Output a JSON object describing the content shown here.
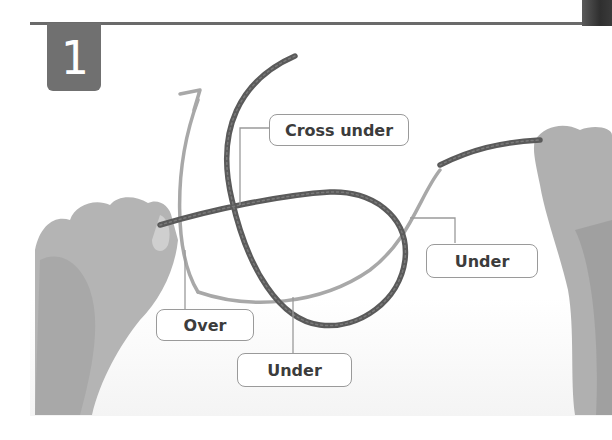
{
  "step": {
    "number": "1"
  },
  "callouts": [
    {
      "id": "cross-under",
      "label": "Cross under"
    },
    {
      "id": "over",
      "label": "Over"
    },
    {
      "id": "under-bottom",
      "label": "Under"
    },
    {
      "id": "under-right",
      "label": "Under"
    }
  ],
  "illustration": {
    "subject": "rope-knot-step",
    "elements": [
      "left-hand",
      "right-hand",
      "rope",
      "direction-arrow"
    ]
  },
  "colors": {
    "badge": "#707070",
    "rope": "#5a5a5a",
    "arrow": "#a8a8a8",
    "callout_border": "#9a9a9a",
    "callout_text": "#3c3c3c",
    "rule": "#6a6a6a"
  }
}
